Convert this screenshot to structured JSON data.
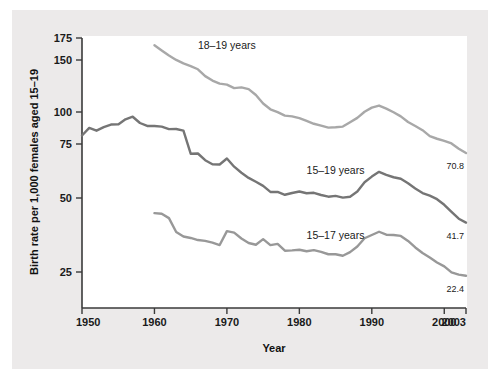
{
  "chart_data": {
    "type": "line",
    "title": "",
    "xlabel": "Year",
    "ylabel": "Birth rate per 1,000 females aged 15–19",
    "xlim": [
      1950,
      2003
    ],
    "ylim": [
      0,
      175
    ],
    "grid": false,
    "legend_position": "inline-labels",
    "xticks": [
      1950,
      1960,
      1970,
      1980,
      1990,
      2000,
      2003
    ],
    "xtick_labels": [
      "1950",
      "1960",
      "1970",
      "1980",
      "1990",
      "2000",
      "2003"
    ],
    "yticks": [
      25,
      50,
      75,
      100,
      150,
      175
    ],
    "ytick_labels": [
      "25",
      "50",
      "75",
      "100",
      "150",
      "175"
    ],
    "y_axis_note": "broken scale: spacing between 100 and 150 is compressed",
    "series": [
      {
        "name": "18–19 years",
        "color": "#a8a8a8",
        "label_x": 1966,
        "label_y": 163,
        "end_label": "70.8",
        "x": [
          1960,
          1961,
          1962,
          1963,
          1964,
          1965,
          1966,
          1967,
          1968,
          1969,
          1970,
          1971,
          1972,
          1973,
          1974,
          1975,
          1976,
          1977,
          1978,
          1979,
          1980,
          1981,
          1982,
          1983,
          1984,
          1985,
          1986,
          1987,
          1988,
          1989,
          1990,
          1991,
          1992,
          1993,
          1994,
          1995,
          1996,
          1997,
          1998,
          1999,
          2000,
          2001,
          2002,
          2003
        ],
        "y": [
          166.7,
          160.9,
          155.1,
          150.1,
          146.8,
          144.2,
          141.1,
          134.5,
          130.2,
          127.3,
          126.3,
          123.0,
          123.7,
          122.0,
          116.3,
          108.2,
          102.6,
          99.9,
          97.2,
          96.6,
          95.2,
          93.0,
          90.8,
          89.4,
          87.8,
          88.1,
          88.6,
          92.0,
          95.4,
          100.2,
          104.2,
          106.2,
          103.2,
          99.8,
          96.6,
          92.2,
          89.1,
          85.8,
          81.2,
          79.1,
          77.4,
          75.4,
          72.8,
          70.8
        ]
      },
      {
        "name": "15–19 years",
        "color": "#757575",
        "label_x": 1981,
        "label_y": 61,
        "end_label": "41.7",
        "x": [
          1950,
          1951,
          1952,
          1953,
          1954,
          1955,
          1956,
          1957,
          1958,
          1959,
          1960,
          1961,
          1962,
          1963,
          1964,
          1965,
          1966,
          1967,
          1968,
          1969,
          1970,
          1971,
          1972,
          1973,
          1974,
          1975,
          1976,
          1977,
          1978,
          1979,
          1980,
          1981,
          1982,
          1983,
          1984,
          1985,
          1986,
          1987,
          1988,
          1989,
          1990,
          1991,
          1992,
          1993,
          1994,
          1995,
          1996,
          1997,
          1998,
          1999,
          2000,
          2001,
          2002,
          2003
        ],
        "y": [
          81.6,
          87.6,
          85.4,
          88.2,
          90.2,
          90.3,
          94.3,
          96.3,
          91.4,
          89.1,
          89.1,
          88.6,
          86.6,
          86.7,
          85.5,
          70.5,
          70.6,
          67.5,
          65.6,
          65.5,
          68.3,
          64.5,
          61.7,
          59.3,
          57.5,
          55.6,
          52.8,
          52.8,
          51.5,
          52.3,
          53.0,
          52.2,
          52.4,
          51.4,
          50.6,
          51.0,
          50.2,
          50.6,
          53.0,
          57.3,
          59.9,
          62.1,
          60.7,
          59.6,
          58.9,
          56.8,
          54.4,
          52.3,
          51.1,
          49.6,
          47.7,
          45.3,
          43.0,
          41.7
        ]
      },
      {
        "name": "15–17 years",
        "color": "#989898",
        "label_x": 1981,
        "label_y": 36,
        "end_label": "22.4",
        "x": [
          1960,
          1961,
          1962,
          1963,
          1964,
          1965,
          1966,
          1967,
          1968,
          1969,
          1970,
          1971,
          1972,
          1973,
          1974,
          1975,
          1976,
          1977,
          1978,
          1979,
          1980,
          1981,
          1982,
          1983,
          1984,
          1985,
          1986,
          1987,
          1988,
          1989,
          1990,
          1991,
          1992,
          1993,
          1994,
          1995,
          1996,
          1997,
          1998,
          1999,
          2000,
          2001,
          2002,
          2003
        ],
        "y": [
          44.9,
          44.7,
          43.2,
          38.5,
          37.0,
          36.5,
          35.8,
          35.5,
          34.9,
          34.1,
          38.8,
          38.3,
          36.3,
          34.8,
          34.2,
          36.1,
          34.1,
          34.5,
          32.2,
          32.3,
          32.5,
          32.0,
          32.4,
          31.8,
          31.0,
          31.0,
          30.5,
          31.7,
          33.6,
          36.4,
          37.5,
          38.6,
          37.6,
          37.5,
          37.2,
          35.5,
          33.3,
          31.4,
          29.9,
          28.2,
          26.9,
          24.7,
          23.2,
          22.4
        ]
      }
    ]
  }
}
